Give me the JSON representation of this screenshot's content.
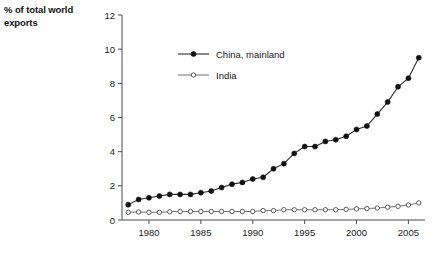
{
  "chart_data": {
    "type": "line",
    "title": "",
    "ylabel": "% of total world exports",
    "xlabel": "",
    "ylim": [
      0,
      12
    ],
    "xlim": [
      1977.4,
      2006.6
    ],
    "yticks": [
      0,
      2,
      4,
      6,
      8,
      10,
      12
    ],
    "xticks": [
      1980,
      1985,
      1990,
      1995,
      2000,
      2005
    ],
    "grid": false,
    "legend_position": "upper-left-inside",
    "x": [
      1978,
      1979,
      1980,
      1981,
      1982,
      1983,
      1984,
      1985,
      1986,
      1987,
      1988,
      1989,
      1990,
      1991,
      1992,
      1993,
      1994,
      1995,
      1996,
      1997,
      1998,
      1999,
      2000,
      2001,
      2002,
      2003,
      2004,
      2005,
      2006
    ],
    "series": [
      {
        "name": "China, mainland",
        "marker": "filled-circle",
        "color": "#111111",
        "values": [
          0.9,
          1.2,
          1.3,
          1.4,
          1.5,
          1.5,
          1.5,
          1.6,
          1.7,
          1.9,
          2.1,
          2.2,
          2.4,
          2.5,
          3.0,
          3.3,
          3.9,
          4.3,
          4.3,
          4.6,
          4.7,
          4.9,
          5.3,
          5.5,
          6.2,
          6.9,
          7.8,
          8.3,
          9.5
        ]
      },
      {
        "name": "India",
        "marker": "open-circle",
        "color": "#5a5a5a",
        "values": [
          0.45,
          0.47,
          0.45,
          0.45,
          0.48,
          0.5,
          0.5,
          0.5,
          0.5,
          0.5,
          0.5,
          0.5,
          0.5,
          0.55,
          0.55,
          0.6,
          0.6,
          0.6,
          0.6,
          0.6,
          0.6,
          0.62,
          0.65,
          0.67,
          0.7,
          0.75,
          0.8,
          0.88,
          1.0
        ]
      }
    ]
  },
  "axis": {
    "y_title_line1": "% of total world",
    "y_title_line2": "exports"
  },
  "legend": {
    "entries": [
      {
        "label": "China, mainland"
      },
      {
        "label": "India"
      }
    ]
  }
}
